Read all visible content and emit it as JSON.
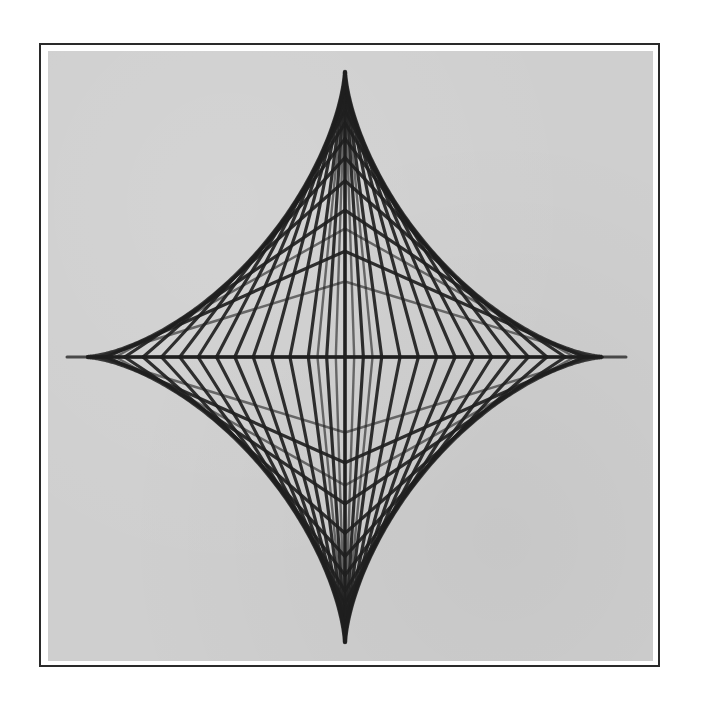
{
  "figure": {
    "center": {
      "x": 345,
      "y": 357
    },
    "segment_length": 281,
    "divisions_per_quadrant": 14,
    "axis": {
      "horizontal": {
        "x1": 67,
        "x2": 626,
        "y": 357
      },
      "vertical_extent": {
        "y_top": 75,
        "y_bottom": 645
      }
    },
    "cusps": {
      "top": {
        "x": 345,
        "y": 75
      },
      "bottom": {
        "x": 345,
        "y": 645
      },
      "left": {
        "x": 86,
        "y": 357
      },
      "right": {
        "x": 600,
        "y": 357
      }
    },
    "colors": {
      "line": "#1f1f1f",
      "axis": "#3a3a3a",
      "plate": "#cfcfcf",
      "frame": "#2a2a2a",
      "background": "#ffffff"
    }
  }
}
